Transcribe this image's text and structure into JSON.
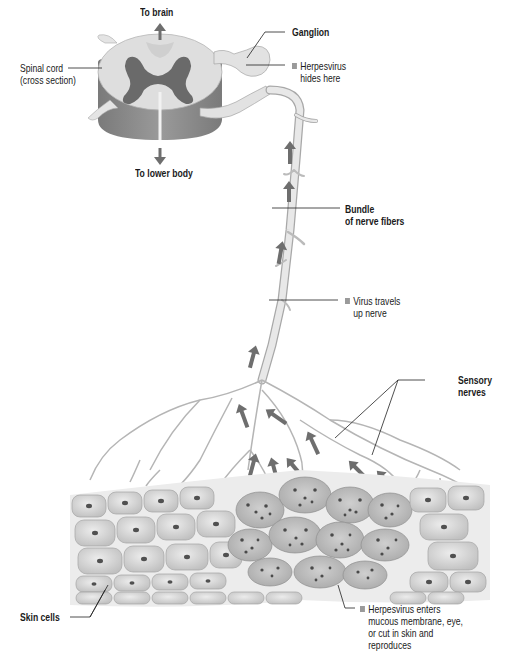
{
  "diagram": {
    "title_context": "Herpesvirus path through sensory nerve",
    "colors": {
      "background": "#ffffff",
      "arrow": "#6e6e6e",
      "nerve_fill": "#e6e6e6",
      "nerve_stroke": "#a8a8a8",
      "cord_top": "#dcdcdc",
      "cord_side": "#8c8c8c",
      "gray_matter": "#6a6a6a",
      "cell_fill": "#d9d9d9",
      "infected_cell_fill": "#bdbdbd",
      "nucleus": "#505050",
      "leader_line": "#222222",
      "bullet": "#9a9a9a"
    },
    "labels": {
      "to_brain": "To brain",
      "to_lower_body": "To lower body",
      "spinal_cord_line1": "Spinal cord",
      "spinal_cord_line2": "(cross section)",
      "ganglion": "Ganglion",
      "herpes_hides_line1": "Herpesvirus",
      "herpes_hides_line2": "hides here",
      "bundle_line1": "Bundle",
      "bundle_line2": "of nerve fibers",
      "virus_travels_line1": "Virus travels",
      "virus_travels_line2": "up nerve",
      "sensory_line1": "Sensory",
      "sensory_line2": "nerves",
      "skin_cells": "Skin cells",
      "enters_line1": "Herpesvirus enters",
      "enters_line2": "mucous membrane, eye,",
      "enters_line3": "or cut in skin and",
      "enters_line4": "reproduces"
    }
  }
}
